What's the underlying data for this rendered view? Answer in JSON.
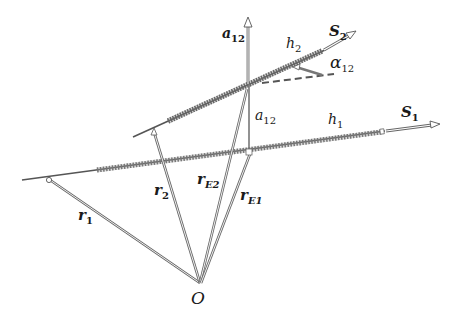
{
  "diagram": {
    "type": "geometry",
    "colors": {
      "line": "#555555",
      "spring": "#777777",
      "text": "#1a1a1a",
      "background": "#ffffff"
    },
    "labels": {
      "origin": "O",
      "r1": {
        "base": "r",
        "sub": "1"
      },
      "r2": {
        "base": "r",
        "sub": "2"
      },
      "rE1": {
        "base": "r",
        "sub": "E1"
      },
      "rE2": {
        "base": "r",
        "sub": "E2"
      },
      "a12_top": {
        "base": "a",
        "sub": "12"
      },
      "a12_mid": {
        "base": "a",
        "sub": "12"
      },
      "h1": {
        "base": "h",
        "sub": "1"
      },
      "h2": {
        "base": "h",
        "sub": "2"
      },
      "S1": {
        "base": "S",
        "sub": "1"
      },
      "S2": {
        "base": "S",
        "sub": "2"
      },
      "alpha12": {
        "base": "α",
        "sub": "12"
      }
    }
  }
}
